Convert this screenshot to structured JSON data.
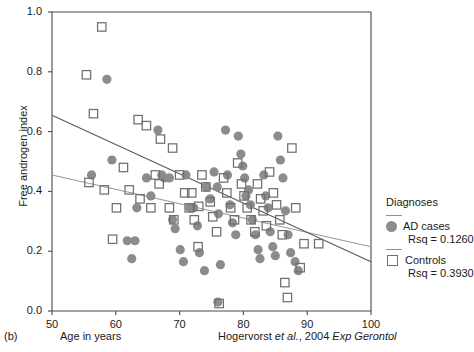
{
  "panel_tag": "(b)",
  "citation": {
    "prefix": "Hogervorst ",
    "italic1": "et al.",
    "middle": ", 2004 ",
    "italic2": "Exp Gerontol"
  },
  "legend": {
    "title": "Diagnoses",
    "entries": [
      {
        "marker": "filled-circle-marker",
        "label": "AD cases",
        "rsq": "Rsq = 0.1260"
      },
      {
        "marker": "open-square-marker",
        "label": "Controls",
        "rsq": "Rsq = 0.3930"
      }
    ]
  },
  "colors": {
    "circle_fill": "#8c8c8c",
    "square_stroke": "#6f6f6f",
    "axis": "#4a4a4a",
    "line_ad": "#5a5a5a",
    "line_controls": "#9a9a9a"
  },
  "chart_data": {
    "type": "scatter",
    "title": "",
    "xlabel": "Age in years",
    "ylabel": "Free androgen index",
    "xlim": [
      50,
      100
    ],
    "ylim": [
      0.0,
      1.0
    ],
    "xticks": [
      50,
      60,
      70,
      80,
      90,
      100
    ],
    "yticks": [
      0.0,
      0.2,
      0.4,
      0.6,
      0.8,
      1.0
    ],
    "xtick_labels": [
      "50",
      "60",
      "70",
      "80",
      "90",
      "100"
    ],
    "ytick_labels": [
      "0.0",
      "0.2",
      "0.4",
      "0.6",
      "0.8",
      "1.0"
    ],
    "grid": false,
    "legend_position": "right",
    "series": [
      {
        "name": "AD cases",
        "marker": "filled-circle",
        "color": "#8c8c8c",
        "rsq": 0.126,
        "trendline": {
          "x": [
            50,
            100
          ],
          "y": [
            0.655,
            0.165
          ],
          "color": "#5a5a5a"
        },
        "points": [
          [
            58.6,
            0.775
          ],
          [
            59.4,
            0.505
          ],
          [
            56.2,
            0.455
          ],
          [
            63.3,
            0.345
          ],
          [
            63.0,
            0.235
          ],
          [
            66.6,
            0.605
          ],
          [
            67.2,
            0.455
          ],
          [
            67.6,
            0.445
          ],
          [
            68.4,
            0.445
          ],
          [
            68.9,
            0.305
          ],
          [
            69.3,
            0.275
          ],
          [
            70.1,
            0.205
          ],
          [
            70.6,
            0.165
          ],
          [
            71.0,
            0.455
          ],
          [
            71.6,
            0.345
          ],
          [
            72.2,
            0.345
          ],
          [
            72.8,
            0.285
          ],
          [
            73.1,
            0.195
          ],
          [
            73.9,
            0.135
          ],
          [
            74.2,
            0.415
          ],
          [
            74.8,
            0.375
          ],
          [
            75.4,
            0.465
          ],
          [
            75.9,
            0.415
          ],
          [
            76.1,
            0.325
          ],
          [
            76.0,
            0.03
          ],
          [
            76.4,
            0.155
          ],
          [
            77.2,
            0.605
          ],
          [
            77.5,
            0.455
          ],
          [
            77.9,
            0.355
          ],
          [
            78.3,
            0.295
          ],
          [
            78.8,
            0.255
          ],
          [
            79.2,
            0.585
          ],
          [
            79.6,
            0.525
          ],
          [
            79.9,
            0.485
          ],
          [
            80.2,
            0.445
          ],
          [
            80.4,
            0.385
          ],
          [
            80.8,
            0.405
          ],
          [
            81.1,
            0.355
          ],
          [
            81.4,
            0.305
          ],
          [
            81.9,
            0.255
          ],
          [
            82.3,
            0.205
          ],
          [
            82.6,
            0.175
          ],
          [
            83.2,
            0.455
          ],
          [
            83.5,
            0.385
          ],
          [
            83.9,
            0.345
          ],
          [
            84.2,
            0.265
          ],
          [
            84.6,
            0.215
          ],
          [
            85.0,
            0.185
          ],
          [
            85.4,
            0.585
          ],
          [
            85.8,
            0.505
          ],
          [
            86.2,
            0.445
          ],
          [
            86.6,
            0.335
          ],
          [
            87.0,
            0.255
          ],
          [
            87.4,
            0.195
          ],
          [
            88.1,
            0.165
          ],
          [
            88.6,
            0.135
          ],
          [
            64.8,
            0.445
          ],
          [
            65.5,
            0.385
          ],
          [
            61.8,
            0.235
          ],
          [
            62.5,
            0.175
          ]
        ]
      },
      {
        "name": "Controls",
        "marker": "open-square",
        "color": "#6f6f6f",
        "rsq": 0.393,
        "trendline": {
          "x": [
            50,
            100
          ],
          "y": [
            0.455,
            0.215
          ],
          "color": "#9a9a9a"
        },
        "points": [
          [
            57.8,
            0.95
          ],
          [
            55.4,
            0.79
          ],
          [
            56.5,
            0.66
          ],
          [
            55.8,
            0.43
          ],
          [
            58.2,
            0.405
          ],
          [
            60.1,
            0.345
          ],
          [
            62.1,
            0.405
          ],
          [
            63.5,
            0.64
          ],
          [
            64.8,
            0.62
          ],
          [
            63.8,
            0.375
          ],
          [
            66.2,
            0.455
          ],
          [
            65.5,
            0.345
          ],
          [
            67.0,
            0.575
          ],
          [
            66.8,
            0.425
          ],
          [
            68.4,
            0.345
          ],
          [
            69.1,
            0.305
          ],
          [
            70.0,
            0.455
          ],
          [
            70.8,
            0.395
          ],
          [
            71.5,
            0.345
          ],
          [
            72.3,
            0.305
          ],
          [
            72.9,
            0.215
          ],
          [
            73.5,
            0.455
          ],
          [
            74.1,
            0.415
          ],
          [
            74.8,
            0.365
          ],
          [
            75.2,
            0.315
          ],
          [
            75.8,
            0.265
          ],
          [
            76.2,
            0.025
          ],
          [
            76.9,
            0.445
          ],
          [
            77.4,
            0.395
          ],
          [
            78.0,
            0.345
          ],
          [
            78.6,
            0.305
          ],
          [
            79.1,
            0.495
          ],
          [
            79.7,
            0.425
          ],
          [
            80.1,
            0.385
          ],
          [
            80.6,
            0.345
          ],
          [
            81.2,
            0.305
          ],
          [
            81.8,
            0.265
          ],
          [
            82.2,
            0.425
          ],
          [
            82.7,
            0.375
          ],
          [
            83.1,
            0.335
          ],
          [
            83.6,
            0.285
          ],
          [
            84.1,
            0.465
          ],
          [
            84.7,
            0.395
          ],
          [
            85.2,
            0.355
          ],
          [
            85.7,
            0.305
          ],
          [
            86.1,
            0.255
          ],
          [
            86.5,
            0.095
          ],
          [
            86.9,
            0.045
          ],
          [
            87.6,
            0.545
          ],
          [
            88.2,
            0.345
          ],
          [
            88.9,
            0.145
          ],
          [
            89.5,
            0.225
          ],
          [
            91.8,
            0.225
          ],
          [
            68.9,
            0.545
          ],
          [
            71.9,
            0.395
          ],
          [
            73.0,
            0.35
          ],
          [
            59.5,
            0.24
          ],
          [
            61.2,
            0.48
          ]
        ]
      }
    ]
  }
}
